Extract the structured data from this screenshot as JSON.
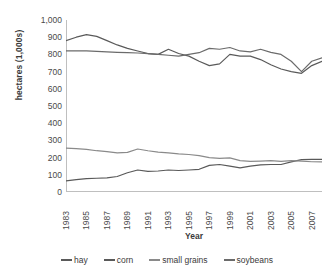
{
  "chart_data": {
    "type": "line",
    "title": "",
    "xlabel": "Year",
    "ylabel": "hectares (1,000s)",
    "x": [
      1983,
      1984,
      1985,
      1986,
      1987,
      1988,
      1989,
      1990,
      1991,
      1992,
      1993,
      1994,
      1995,
      1996,
      1997,
      1998,
      1999,
      2000,
      2001,
      2002,
      2003,
      2004,
      2005,
      2006,
      2007,
      2008
    ],
    "xtick_labels": [
      "1983",
      "1985",
      "1987",
      "1989",
      "1991",
      "1993",
      "1995",
      "1997",
      "1999",
      "2001",
      "2003",
      "2005",
      "2007"
    ],
    "ytick_labels": [
      "1,000",
      "900",
      "800",
      "700",
      "600",
      "500",
      "400",
      "300",
      "200",
      "100",
      "0"
    ],
    "ylim": [
      0,
      1000
    ],
    "ytick_step": 100,
    "xlim": [
      1983,
      2008
    ],
    "grid": false,
    "legend_position": "bottom",
    "series": [
      {
        "name": "hay",
        "color": "#5a5a5a",
        "values": [
          880,
          900,
          915,
          905,
          880,
          855,
          835,
          820,
          805,
          800,
          830,
          805,
          790,
          760,
          735,
          745,
          800,
          790,
          790,
          770,
          740,
          715,
          700,
          690,
          735,
          760
        ]
      },
      {
        "name": "corn",
        "color": "#595959",
        "values": [
          65,
          72,
          78,
          80,
          82,
          90,
          112,
          128,
          120,
          122,
          128,
          125,
          128,
          132,
          155,
          160,
          150,
          140,
          150,
          158,
          160,
          160,
          175,
          188,
          190,
          190
        ]
      },
      {
        "name": "small grains",
        "color": "#8a8a8a",
        "values": [
          255,
          252,
          248,
          240,
          235,
          228,
          230,
          250,
          240,
          232,
          228,
          222,
          218,
          212,
          200,
          195,
          198,
          182,
          178,
          180,
          182,
          178,
          182,
          180,
          176,
          175
        ]
      },
      {
        "name": "soybeans",
        "color": "#6b6b6b",
        "values": [
          820,
          820,
          820,
          818,
          815,
          812,
          810,
          808,
          805,
          800,
          795,
          790,
          800,
          810,
          835,
          830,
          840,
          820,
          815,
          830,
          812,
          800,
          760,
          700,
          760,
          780
        ]
      }
    ]
  },
  "axis": {
    "axis_line_color": "#bfbfbf",
    "tick_color": "#bfbfbf"
  }
}
